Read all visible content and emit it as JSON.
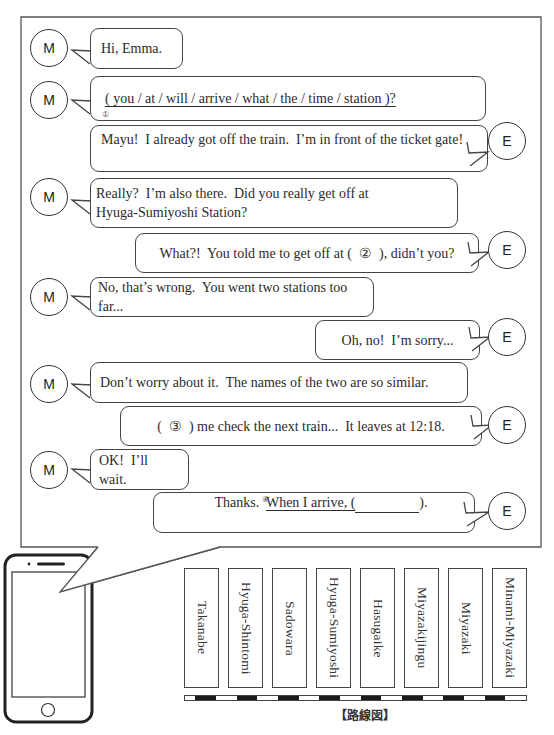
{
  "conversation": {
    "speakers": {
      "mayu": {
        "initial": "M"
      },
      "emma": {
        "initial": "E"
      }
    },
    "messages": [
      {
        "speaker": "M",
        "text": "Hi, Emma."
      },
      {
        "speaker": "M",
        "text": "( you / at / will / arrive / what / the / time / station )?",
        "marker": "①"
      },
      {
        "speaker": "E",
        "text": "Mayu!  I already got off the train.  I’m in front of the ticket gate!"
      },
      {
        "speaker": "M",
        "text": "Really?  I’m also there.  Did you really get off at Hyuga-Sumiyoshi Station?"
      },
      {
        "speaker": "E",
        "text": "What?!  You told me to get off at (  ②  ), didn’t you?"
      },
      {
        "speaker": "M",
        "text": "No, that’s wrong.  You went two stations too far..."
      },
      {
        "speaker": "E",
        "text": "Oh, no!  I’m sorry..."
      },
      {
        "speaker": "M",
        "text": "Don’t worry about it.  The names of the two are so similar."
      },
      {
        "speaker": "E",
        "text": "(  ③  ) me check the next train...  It leaves at 12:18."
      },
      {
        "speaker": "M",
        "text": "OK!  I’ll wait."
      },
      {
        "speaker": "E",
        "text_before": "Thanks.  ",
        "text_underlined": "When I arrive, (",
        "text_after": ").",
        "marker": "④"
      }
    ]
  },
  "route_map": {
    "caption": "【路線図】",
    "stations": [
      "Takanabe",
      "Hyuga-Shintomi",
      "Sadowara",
      "Hyuga-Sumiyoshi",
      "Hasugaike",
      "Miyazakijingu",
      "Miyazaki",
      "Minami-Miyazaki"
    ]
  },
  "colors": {
    "line": "#444444",
    "rail_dark": "#1a1a1a",
    "rail_light": "#ffffff"
  }
}
